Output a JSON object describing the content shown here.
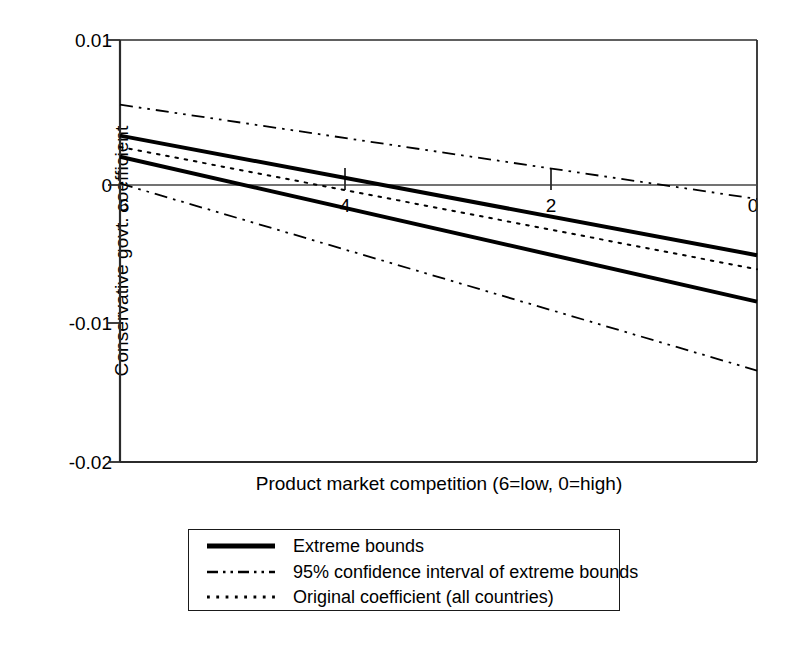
{
  "chart_data": {
    "type": "line",
    "title": "",
    "xlabel": "Product market competition (6=low, 0=high)",
    "ylabel": "Conservative govt. coefficient",
    "xlim": [
      6,
      0
    ],
    "ylim": [
      -0.02,
      0.01
    ],
    "x_ticks": [
      6,
      4,
      2,
      0
    ],
    "x_tick_labels": [
      "6",
      "4",
      "2",
      "0"
    ],
    "y_ticks": [
      0.01,
      0,
      -0.01,
      -0.02
    ],
    "y_tick_labels": [
      "0.01",
      "0",
      "-0.01",
      "-0.02"
    ],
    "x_axis_reversed": true,
    "grid": false,
    "zero_line": true,
    "legend_position": "below-plot",
    "series": [
      {
        "name": "Extreme bounds (upper)",
        "legend_label": "Extreme bounds",
        "style": "solid",
        "width": 4,
        "color": "#000000",
        "x": [
          6,
          0
        ],
        "values": [
          0.0032,
          -0.0053
        ]
      },
      {
        "name": "Extreme bounds (lower)",
        "legend_label": "Extreme bounds",
        "style": "solid",
        "width": 4,
        "color": "#000000",
        "x": [
          6,
          0
        ],
        "values": [
          0.0017,
          -0.0086
        ]
      },
      {
        "name": "95% confidence interval of extreme bounds (upper)",
        "legend_label": "95% confidence interval of extreme bounds",
        "style": "dash-dot-dot",
        "width": 1.8,
        "color": "#000000",
        "x": [
          6,
          0
        ],
        "values": [
          0.0054,
          -0.0013
        ]
      },
      {
        "name": "95% confidence interval of extreme bounds (lower)",
        "legend_label": "95% confidence interval of extreme bounds",
        "style": "dash-dot-dot",
        "width": 1.8,
        "color": "#000000",
        "x": [
          6,
          0
        ],
        "values": [
          -0.0002,
          -0.0135
        ]
      },
      {
        "name": "Original coefficient (all countries)",
        "legend_label": "Original coefficient (all countries)",
        "style": "dotted",
        "width": 2,
        "color": "#000000",
        "x": [
          6,
          0
        ],
        "values": [
          0.0024,
          -0.0063
        ]
      }
    ],
    "legend_entries": [
      {
        "label": "Extreme bounds",
        "style": "solid"
      },
      {
        "label": "95% confidence interval of extreme bounds",
        "style": "dash-dot-dot"
      },
      {
        "label": "Original coefficient (all countries)",
        "style": "dotted"
      }
    ]
  }
}
